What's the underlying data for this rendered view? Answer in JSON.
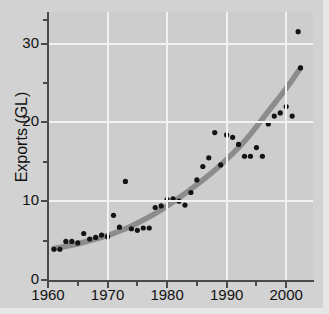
{
  "chart_data": {
    "type": "scatter",
    "title": "",
    "xlabel": "",
    "ylabel": "Exports (GL)",
    "xlim": [
      1960,
      2004.5
    ],
    "ylim": [
      0,
      34
    ],
    "grid": true,
    "legend": null,
    "x_ticks_major": [
      1960,
      1970,
      1980,
      1990,
      2000
    ],
    "x_ticks_minor": [
      1965,
      1975,
      1985,
      1995
    ],
    "y_ticks_major": [
      0,
      10,
      20,
      30
    ],
    "y_ticks_minor": [
      5,
      15,
      25
    ],
    "x_tick_labels": [
      "1960",
      "1970",
      "1980",
      "1990",
      "2000"
    ],
    "y_tick_labels": [
      "0",
      "10",
      "20",
      "30"
    ],
    "marker": "filled-circle",
    "marker_color": "#141414",
    "panel_color": "#cdcdcd",
    "gridline_color": "#f2f2f2",
    "figure_background": "#d2d2d2",
    "axis_color": "#4a4a4a",
    "points": [
      {
        "x": 1961,
        "y": 3.9
      },
      {
        "x": 1962,
        "y": 3.9
      },
      {
        "x": 1963,
        "y": 4.9
      },
      {
        "x": 1964,
        "y": 4.9
      },
      {
        "x": 1965,
        "y": 4.7
      },
      {
        "x": 1966,
        "y": 5.9
      },
      {
        "x": 1967,
        "y": 5.2
      },
      {
        "x": 1968,
        "y": 5.4
      },
      {
        "x": 1969,
        "y": 5.7
      },
      {
        "x": 1970,
        "y": 5.5
      },
      {
        "x": 1971,
        "y": 8.2
      },
      {
        "x": 1972,
        "y": 6.7
      },
      {
        "x": 1973,
        "y": 12.5
      },
      {
        "x": 1974,
        "y": 6.5
      },
      {
        "x": 1975,
        "y": 6.3
      },
      {
        "x": 1976,
        "y": 6.6
      },
      {
        "x": 1977,
        "y": 6.6
      },
      {
        "x": 1978,
        "y": 9.2
      },
      {
        "x": 1979,
        "y": 9.4
      },
      {
        "x": 1980,
        "y": 10.2
      },
      {
        "x": 1981,
        "y": 10.3
      },
      {
        "x": 1982,
        "y": 10.0
      },
      {
        "x": 1983,
        "y": 9.5
      },
      {
        "x": 1984,
        "y": 11.1
      },
      {
        "x": 1985,
        "y": 12.7
      },
      {
        "x": 1986,
        "y": 14.4
      },
      {
        "x": 1987,
        "y": 15.5
      },
      {
        "x": 1988,
        "y": 18.7
      },
      {
        "x": 1989,
        "y": 14.6
      },
      {
        "x": 1990,
        "y": 18.4
      },
      {
        "x": 1991,
        "y": 18.1
      },
      {
        "x": 1992,
        "y": 17.2
      },
      {
        "x": 1993,
        "y": 15.7
      },
      {
        "x": 1994,
        "y": 15.7
      },
      {
        "x": 1995,
        "y": 16.8
      },
      {
        "x": 1996,
        "y": 15.7
      },
      {
        "x": 1997,
        "y": 19.8
      },
      {
        "x": 1998,
        "y": 20.8
      },
      {
        "x": 1999,
        "y": 21.2
      },
      {
        "x": 2000,
        "y": 22.0
      },
      {
        "x": 2001,
        "y": 20.8
      },
      {
        "x": 2002,
        "y": 31.5
      },
      {
        "x": 2002.4,
        "y": 26.9
      }
    ],
    "trend": {
      "style": "smooth-exponential-fit",
      "color": "#8c8c8c",
      "width": 5.5,
      "x": [
        1961,
        1965,
        1969,
        1973,
        1977,
        1981,
        1985,
        1989,
        1993,
        1997,
        2000,
        2002.4
      ],
      "y": [
        4.0,
        4.6,
        5.4,
        6.5,
        8.0,
        9.9,
        12.1,
        14.6,
        17.6,
        21.4,
        24.3,
        26.9
      ]
    }
  }
}
